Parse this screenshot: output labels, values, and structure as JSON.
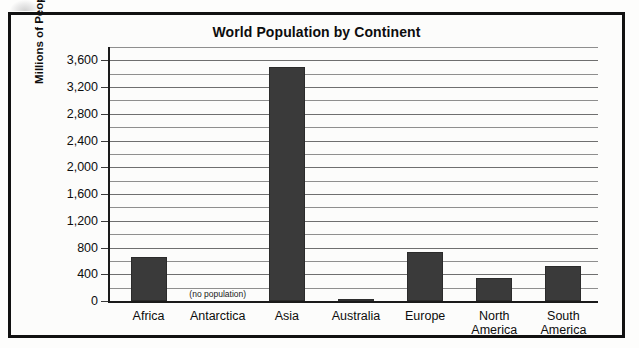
{
  "figure": {
    "title": "World Population by Continent"
  },
  "chart_data": {
    "type": "bar",
    "title": "World Population by Continent",
    "xlabel": "",
    "ylabel": "Millions of People",
    "ylim": [
      0,
      3800
    ],
    "grid": true,
    "legend": false,
    "major_tick_step": 400,
    "minor_gridline_step": 200,
    "categories": [
      "Africa",
      "Antarctica",
      "Asia",
      "Australia",
      "Europe",
      "North\nAmerica",
      "South\nAmerica"
    ],
    "values": [
      660,
      0,
      3500,
      20,
      730,
      350,
      520
    ],
    "tick_labels": [
      "0",
      "400",
      "800",
      "1,200",
      "1,600",
      "2,000",
      "2,400",
      "2,800",
      "3,200",
      "3,600"
    ],
    "tick_values": [
      0,
      400,
      800,
      1200,
      1600,
      2000,
      2400,
      2800,
      3200,
      3600
    ],
    "annotations": [
      {
        "category": "Antarctica",
        "text": "(no population)"
      }
    ],
    "colors": {
      "bar": "#3a3a3a",
      "grid": "#8e8e8e",
      "axis": "#1a1a1a",
      "text": "#0d0d0d",
      "background": "#fcfcfb",
      "frame": "#111111"
    }
  }
}
